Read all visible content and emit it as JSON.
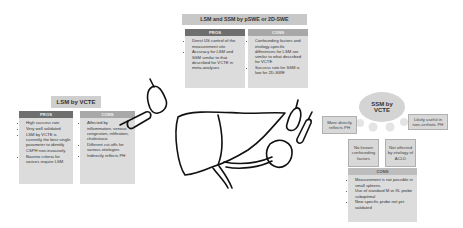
{
  "top_panel": {
    "title": "LSM and SSM by pSWE or 2D-SWE",
    "pros_label": "PROS",
    "pros": [
      "Direct US control of the measurement site",
      "Accuracy for LSM and SSM similar to that described for VCTE in meta-analyses"
    ],
    "cons_label": "CONS",
    "cons": [
      "Confounding factors and etiology-specific differences for LSM are similar to what described for VCTE",
      "Success rate for SSM is low for 2D-SWE"
    ]
  },
  "left_panel": {
    "title": "LSM by VCTE",
    "pros_label": "PROS",
    "pros": [
      "High success rate",
      "Very well validated",
      "LSM by VCTE is currently the best single parameter to identify CSPH non-invasively",
      "Baveno criteria for varices require LSM"
    ],
    "cons_label": "CONS",
    "cons": [
      "Affected by inflammation, venous congestion, infiltration, cholestasis",
      "Different cut-offs for various etiologies",
      "Indirectly reflects PH"
    ]
  },
  "right_panel": {
    "title": "SSM by VCTE",
    "features": [
      "More directly reflects PH",
      "No known confounding factors",
      "Not affected by etiology of ACLD",
      "Likely useful in non-cirrhotic PH"
    ],
    "cons_label": "CONS",
    "cons": [
      "Measurement is not possible in small spleens",
      "Use of standard M or XL probe suboptimal",
      "New specific probe not yet validated"
    ]
  }
}
